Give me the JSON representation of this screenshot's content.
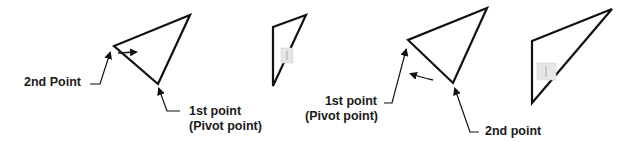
{
  "diagram": {
    "stroke_color": "#111111",
    "marker_color": "#eaeaea",
    "left_example": {
      "second_point_label": "2nd Point",
      "first_point_label": "1st point",
      "pivot_label": "(Pivot point)",
      "before_triangle": [
        [
          190,
          15
        ],
        [
          114,
          46
        ],
        [
          158,
          84
        ]
      ],
      "after_triangle": [
        [
          306,
          15
        ],
        [
          273,
          27
        ],
        [
          273,
          86
        ]
      ]
    },
    "right_example": {
      "first_point_label": "1st point",
      "pivot_label": "(Pivot point)",
      "second_point_label": "2nd point",
      "before_triangle": [
        [
          487,
          8
        ],
        [
          408,
          40
        ],
        [
          453,
          83
        ]
      ],
      "after_triangle": [
        [
          612,
          9
        ],
        [
          532,
          41
        ],
        [
          532,
          103
        ]
      ]
    }
  }
}
